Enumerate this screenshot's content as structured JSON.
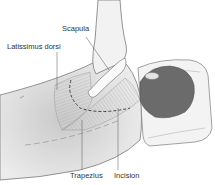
{
  "figure": {
    "labels": {
      "scapula": "Scapula",
      "latissimus": "Latissimus dorsi",
      "trapezius": "Trapezius",
      "incision": "Incision"
    },
    "colors": {
      "background": "#ffffff",
      "skin": "#efefef",
      "skin_shadow": "#d6d6d6",
      "muscle": "#bdbdbd",
      "hair": "#6b6b6b",
      "pillow": "#f2f2f2",
      "outline": "#7a7a7a",
      "text": "#333333"
    }
  }
}
